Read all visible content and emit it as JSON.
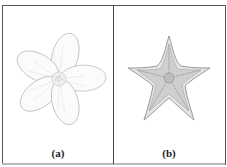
{
  "figure": {
    "panels": [
      {
        "label": "(a)",
        "subject": "flower-sketch",
        "stroke_color": "#b8b8b8"
      },
      {
        "label": "(b)",
        "subject": "starfish-sketch",
        "stroke_color": "#8a8a8a"
      }
    ],
    "border_color": "#555555"
  }
}
